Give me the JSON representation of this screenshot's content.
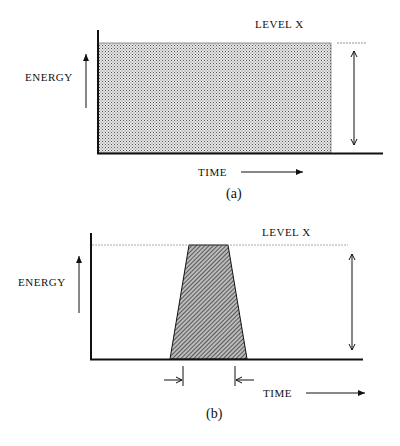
{
  "panel_a": {
    "caption": "(a)",
    "y_label": "ENERGY",
    "x_label": "TIME",
    "level_label": "LEVEL X",
    "shape": "rectangle",
    "fill_pattern": "stipple"
  },
  "panel_b": {
    "caption": "(b)",
    "y_label": "ENERGY",
    "x_label": "TIME",
    "level_label": "LEVEL X",
    "shape": "trapezoid",
    "fill_pattern": "diagonal-hatch"
  },
  "colors": {
    "ink": "#111111",
    "fill_a": "#c8c8c8"
  }
}
